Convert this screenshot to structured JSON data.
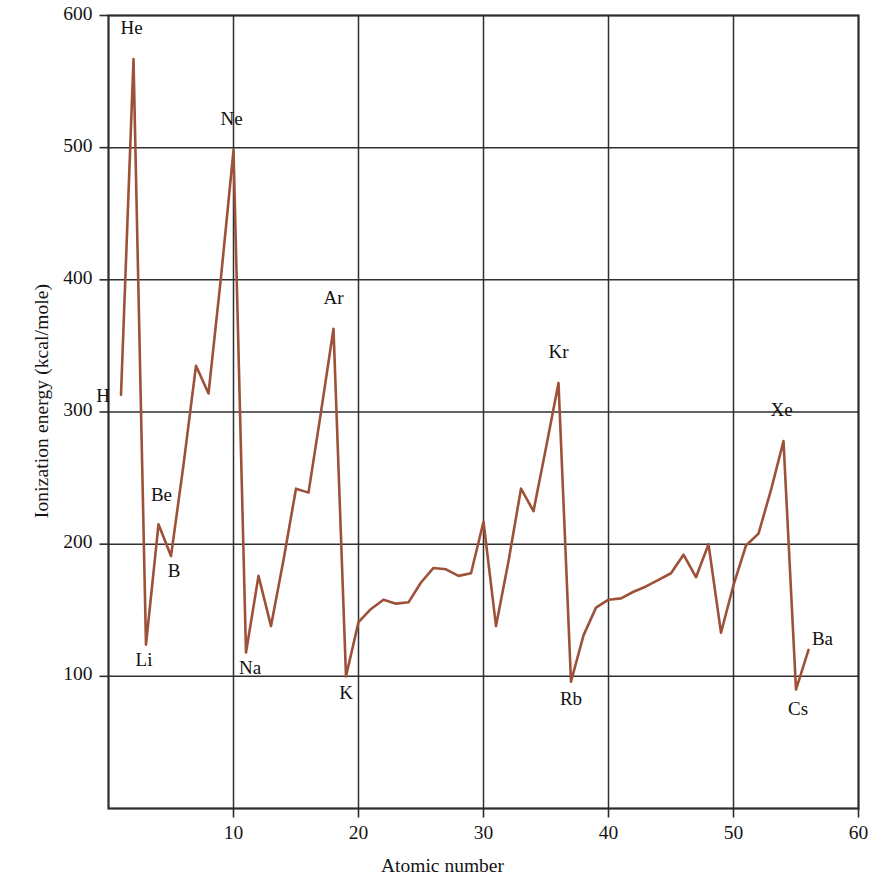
{
  "chart_data": {
    "type": "line",
    "title": "",
    "xlabel": "Atomic number",
    "ylabel": "Ionization energy (kcal/mole)",
    "xlim": [
      0,
      60
    ],
    "ylim": [
      0,
      600
    ],
    "xticks": [
      "10",
      "20",
      "30",
      "40",
      "50",
      "60"
    ],
    "xtick_values": [
      10,
      20,
      30,
      40,
      50,
      60
    ],
    "yticks": [
      "100",
      "200",
      "300",
      "400",
      "500",
      "600"
    ],
    "ytick_values": [
      100,
      200,
      300,
      400,
      500,
      600
    ],
    "grid": true,
    "legend": "none",
    "series_name": "First ionization energy",
    "line_color": "#9d5139",
    "axis_color": "#2b2b2b",
    "x": [
      1,
      2,
      3,
      4,
      5,
      6,
      7,
      8,
      9,
      10,
      11,
      12,
      13,
      14,
      15,
      16,
      17,
      18,
      19,
      20,
      21,
      22,
      23,
      24,
      25,
      26,
      27,
      28,
      29,
      30,
      31,
      32,
      33,
      34,
      35,
      36,
      37,
      38,
      39,
      40,
      41,
      42,
      43,
      44,
      45,
      46,
      47,
      48,
      49,
      50,
      51,
      52,
      53,
      54,
      55,
      56
    ],
    "y": [
      313,
      567,
      124,
      215,
      191,
      260,
      335,
      314,
      402,
      498,
      118,
      176,
      138,
      188,
      242,
      239,
      300,
      363,
      100,
      141,
      151,
      158,
      155,
      156,
      171,
      182,
      181,
      176,
      178,
      217,
      138,
      187,
      242,
      225,
      273,
      322,
      96,
      131,
      152,
      158,
      159,
      164,
      168,
      173,
      178,
      192,
      175,
      200,
      133,
      169,
      199,
      208,
      241,
      278,
      90,
      120
    ],
    "labeled_points": [
      {
        "element": "H",
        "z": 1,
        "energy": 313,
        "label_dx": -18,
        "label_dy": 2
      },
      {
        "element": "He",
        "z": 2,
        "energy": 567,
        "label_dx": -2,
        "label_dy": -30
      },
      {
        "element": "Li",
        "z": 3,
        "energy": 124,
        "label_dx": -2,
        "label_dy": 16
      },
      {
        "element": "Be",
        "z": 4,
        "energy": 215,
        "label_dx": 3,
        "label_dy": -28
      },
      {
        "element": "B",
        "z": 5,
        "energy": 191,
        "label_dx": 3,
        "label_dy": 16
      },
      {
        "element": "Ne",
        "z": 10,
        "energy": 498,
        "label_dx": -2,
        "label_dy": -30
      },
      {
        "element": "Na",
        "z": 11,
        "energy": 118,
        "label_dx": 4,
        "label_dy": 16
      },
      {
        "element": "Ar",
        "z": 18,
        "energy": 363,
        "label_dx": 0,
        "label_dy": -30
      },
      {
        "element": "K",
        "z": 19,
        "energy": 100,
        "label_dx": 0,
        "label_dy": 18
      },
      {
        "element": "Kr",
        "z": 36,
        "energy": 322,
        "label_dx": 0,
        "label_dy": -30
      },
      {
        "element": "Rb",
        "z": 37,
        "energy": 96,
        "label_dx": 0,
        "label_dy": 18
      },
      {
        "element": "Xe",
        "z": 54,
        "energy": 278,
        "label_dx": -2,
        "label_dy": -30
      },
      {
        "element": "Cs",
        "z": 55,
        "energy": 90,
        "label_dx": 2,
        "label_dy": 20
      },
      {
        "element": "Ba",
        "z": 56,
        "energy": 120,
        "label_dx": 14,
        "label_dy": -10
      }
    ]
  },
  "figure": {
    "background_color": "#ffffff"
  }
}
